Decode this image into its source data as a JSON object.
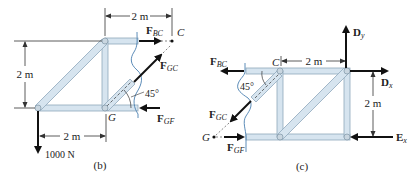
{
  "panel_b": {
    "caption": "(b)",
    "dim_top": "2 m",
    "dim_left": "2 m",
    "dim_bottom": "2 m",
    "angle": "45°",
    "load": "1000 N",
    "joint_G": "G",
    "point_C": "C",
    "forces": {
      "F_BC": {
        "main": "F",
        "sub": "BC"
      },
      "F_GC": {
        "main": "F",
        "sub": "GC"
      },
      "F_GF": {
        "main": "F",
        "sub": "GF"
      }
    }
  },
  "panel_c": {
    "caption": "(c)",
    "dim_top": "2 m",
    "dim_right": "2 m",
    "angle": "45°",
    "joint_C": "C",
    "point_G": "G",
    "forces": {
      "F_BC": {
        "main": "F",
        "sub": "BC"
      },
      "F_GC": {
        "main": "F",
        "sub": "GC"
      },
      "F_GF": {
        "main": "F",
        "sub": "GF"
      },
      "D_y": {
        "main": "D",
        "sub": "y"
      },
      "D_x": {
        "main": "D",
        "sub": "x"
      },
      "E_x": {
        "main": "E",
        "sub": "x"
      }
    }
  },
  "colors": {
    "member_fill": "#d6e4ef",
    "member_stroke": "#8fa8bb",
    "cut_line": "#4a7fb0",
    "force": "#111111"
  }
}
